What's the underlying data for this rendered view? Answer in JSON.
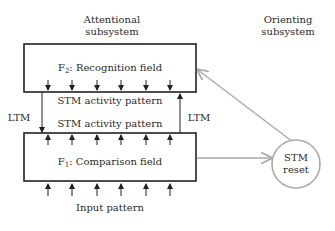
{
  "diagram": {
    "attentional_label": [
      "Attentional",
      "subsystem"
    ],
    "orienting_label": [
      "Orienting",
      "subsystem"
    ],
    "f2": {
      "prefix": "F",
      "subscript": "2",
      "label": ": Recognition field"
    },
    "f1": {
      "prefix": "F",
      "subscript": "1",
      "label": ": Comparison field"
    },
    "stm_top": "STM activity pattern",
    "stm_bottom": "STM activity pattern",
    "ltm_left": "LTM",
    "ltm_right": "LTM",
    "reset": [
      "STM",
      "reset"
    ],
    "input": "Input pattern",
    "colors": {
      "box": "#222222",
      "gray_arrow": "#a9a9a9"
    }
  }
}
